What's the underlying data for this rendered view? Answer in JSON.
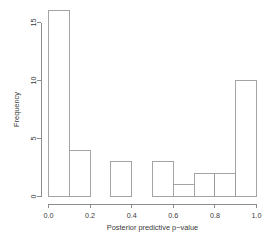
{
  "chart_data": {
    "type": "bar",
    "subtype": "histogram",
    "title": "",
    "xlabel": "Posterior predictive p−value",
    "ylabel": "Frequency",
    "bin_width": 0.1,
    "bin_edges": [
      0.0,
      0.1,
      0.2,
      0.3,
      0.4,
      0.5,
      0.6,
      0.7,
      0.8,
      0.9,
      1.0
    ],
    "categories": [
      "0.0–0.1",
      "0.1–0.2",
      "0.2–0.3",
      "0.3–0.4",
      "0.4–0.5",
      "0.5–0.6",
      "0.6–0.7",
      "0.7–0.8",
      "0.8–0.9",
      "0.9–1.0"
    ],
    "values": [
      16,
      4,
      0,
      3,
      0,
      3,
      1,
      2,
      2,
      10
    ],
    "xlim": [
      0.0,
      1.0
    ],
    "ylim": [
      0,
      16
    ],
    "x_ticks": [
      0.0,
      0.2,
      0.4,
      0.6,
      0.8,
      1.0
    ],
    "x_tick_labels": [
      "0.0",
      "0.2",
      "0.4",
      "0.6",
      "0.8",
      "1.0"
    ],
    "y_ticks": [
      0,
      5,
      10,
      15
    ],
    "y_tick_labels": [
      "0",
      "5",
      "10",
      "15"
    ],
    "grid": false,
    "legend": null,
    "bar_fill_color": "#ffffff",
    "bar_stroke_color": "#9a9a9a",
    "axis_color": "#808080",
    "text_color": "#3a3a3a",
    "background_color": "#ffffff"
  }
}
